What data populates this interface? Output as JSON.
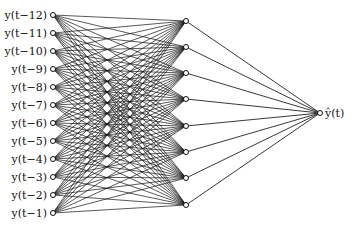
{
  "diagram": {
    "type": "feedforward-neural-network",
    "input_layer": {
      "count": 12,
      "labels": [
        "y(t−12)",
        "y(t−11)",
        "y(t−10)",
        "y(t−9)",
        "y(t−8)",
        "y(t−7)",
        "y(t−6)",
        "y(t−5)",
        "y(t−4)",
        "y(t−3)",
        "y(t−2)",
        "y(t−1)"
      ],
      "x": 53,
      "y_start": 15,
      "y_step": 18
    },
    "hidden_layer": {
      "count": 8,
      "x": 186,
      "y_positions": [
        21,
        47,
        73,
        99,
        126,
        152,
        178,
        205
      ]
    },
    "output_layer": {
      "count": 1,
      "label": "ŷ(t)",
      "x": 320,
      "y": 113
    },
    "colors": {
      "edge": "#111111",
      "background": "#ffffff"
    }
  }
}
